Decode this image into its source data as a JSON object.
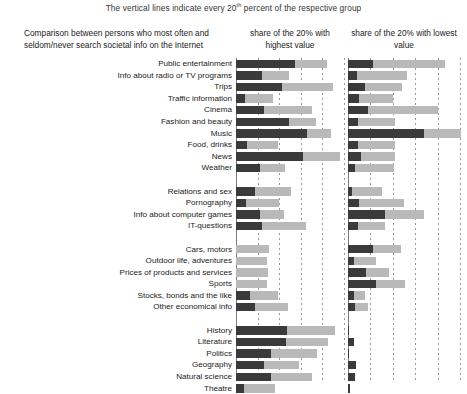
{
  "subtitle_pre": "The vertical lines indicate every 20",
  "subtitle_sup": "th",
  "subtitle_post": " percent of the respective group",
  "caption": "Comparison between persons who most often and seldom/never search societal info on the Internet",
  "col_left_head": "share of the 20% with highest value",
  "col_right_head": "share of the 20% with lowest value",
  "chart_data": {
    "type": "bar",
    "orientation": "horizontal",
    "stacked": true,
    "title": "Comparison between persons who most often and seldom/never search societal info on the Internet",
    "subtitle": "The vertical lines indicate every 20th percent of the respective group",
    "xlabel": "",
    "ylabel": "",
    "xlim": [
      0,
      100
    ],
    "grid": true,
    "gridline_every": 20,
    "legend_position": "top",
    "panels": [
      {
        "name": "left",
        "label": "share of the 20% with highest value"
      },
      {
        "name": "right",
        "label": "share of the 20% with lowest value"
      }
    ],
    "series": [
      {
        "name": "dark-segment",
        "color": "#3a3a3a"
      },
      {
        "name": "light-segment",
        "color": "#b9b9b9"
      }
    ],
    "groups": [
      {
        "name": "entertainment",
        "categories": [
          "Public entertainment",
          "Info about radio or TV programs",
          "Trips",
          "Traffic information",
          "Cinema",
          "Fashion and beauty",
          "Music",
          "Food, drinks",
          "News",
          "Weather"
        ],
        "left": [
          [
            55,
            29
          ],
          [
            24,
            25
          ],
          [
            43,
            47
          ],
          [
            8,
            26
          ],
          [
            26,
            44
          ],
          [
            49,
            25
          ],
          [
            66,
            22
          ],
          [
            10,
            29
          ],
          [
            62,
            34
          ],
          [
            22,
            23
          ]
        ],
        "right": [
          [
            22,
            65
          ],
          [
            8,
            45
          ],
          [
            15,
            33
          ],
          [
            10,
            30
          ],
          [
            18,
            62
          ],
          [
            9,
            33
          ],
          [
            68,
            33
          ],
          [
            9,
            33
          ],
          [
            12,
            30
          ],
          [
            6,
            35
          ]
        ]
      },
      {
        "name": "personal",
        "categories": [
          "Relations and sex",
          "Pornography",
          "Info about computer games",
          "IT-questions"
        ],
        "left": [
          [
            18,
            33
          ],
          [
            9,
            31
          ],
          [
            22,
            22
          ],
          [
            24,
            41
          ]
        ],
        "right": [
          [
            4,
            26
          ],
          [
            10,
            40
          ],
          [
            33,
            35
          ],
          [
            9,
            24
          ]
        ]
      },
      {
        "name": "practical",
        "categories": [
          "Cars, motors",
          "Outdoor life, adventures",
          "Prices of products and services",
          "Sports",
          "Stocks, bonds and the like",
          "Other economical info"
        ],
        "left": [
          [
            0,
            31
          ],
          [
            0,
            29
          ],
          [
            0,
            30
          ],
          [
            0,
            29
          ],
          [
            13,
            26
          ],
          [
            18,
            30
          ]
        ],
        "right": [
          [
            22,
            25
          ],
          [
            5,
            20
          ],
          [
            16,
            21
          ],
          [
            25,
            26
          ],
          [
            5,
            10
          ],
          [
            6,
            12
          ]
        ]
      },
      {
        "name": "knowledge",
        "categories": [
          "History",
          "Literature",
          "Politics",
          "Geography",
          "Natural science",
          "Theatre"
        ],
        "left": [
          [
            47,
            45
          ],
          [
            46,
            39
          ],
          [
            32,
            43
          ],
          [
            26,
            32
          ],
          [
            32,
            38
          ],
          [
            7,
            29
          ]
        ],
        "right": [
          [
            1,
            0
          ],
          [
            5,
            0
          ],
          [
            1,
            0
          ],
          [
            7,
            0
          ],
          [
            6,
            0
          ],
          [
            2,
            0
          ]
        ]
      }
    ]
  }
}
